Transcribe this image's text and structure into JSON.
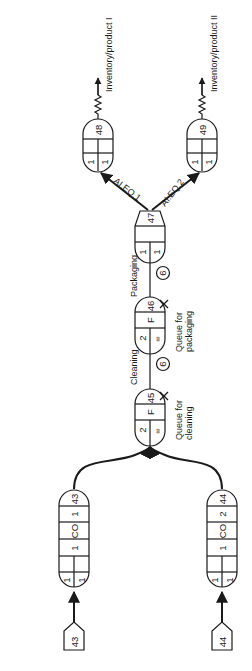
{
  "diagram": {
    "title": "",
    "sources": [
      {
        "id": "43"
      },
      {
        "id": "44"
      }
    ],
    "nodes": {
      "n43": {
        "number": "43",
        "cells": [
          "1",
          "CO",
          "1"
        ],
        "bottom": [
          "1",
          "1"
        ]
      },
      "n44": {
        "number": "44",
        "cells": [
          "2",
          "CO",
          "1"
        ],
        "bottom": [
          "1",
          "1"
        ]
      },
      "n45": {
        "number": "45",
        "type": "F",
        "bottom": [
          "2",
          "∞"
        ]
      },
      "n46": {
        "number": "46",
        "type": "F",
        "bottom": [
          "2",
          "∞"
        ]
      },
      "n47": {
        "number": "47",
        "bottom": [
          "1",
          "1"
        ]
      },
      "n48": {
        "number": "48",
        "bottom": [
          "1",
          "1"
        ]
      },
      "n49": {
        "number": "49",
        "bottom": [
          "1",
          "1"
        ]
      }
    },
    "activities": {
      "cleaning": {
        "label": "Cleaning",
        "duration": "6"
      },
      "packaging": {
        "label": "Packaging",
        "duration": "6"
      }
    },
    "queues": {
      "q45": {
        "line1": "Queue for",
        "line2": "cleaning"
      },
      "q46": {
        "line1": "Queue for",
        "line2": "packaging"
      }
    },
    "branches": {
      "b1": "AI.EQ.1",
      "b2": "AI.EQ.2"
    },
    "sinks": {
      "s1": "Inventory/product I",
      "s2": "Inventory/product II"
    }
  },
  "colors": {
    "line": "#1a1a1a",
    "background": "#ffffff"
  }
}
